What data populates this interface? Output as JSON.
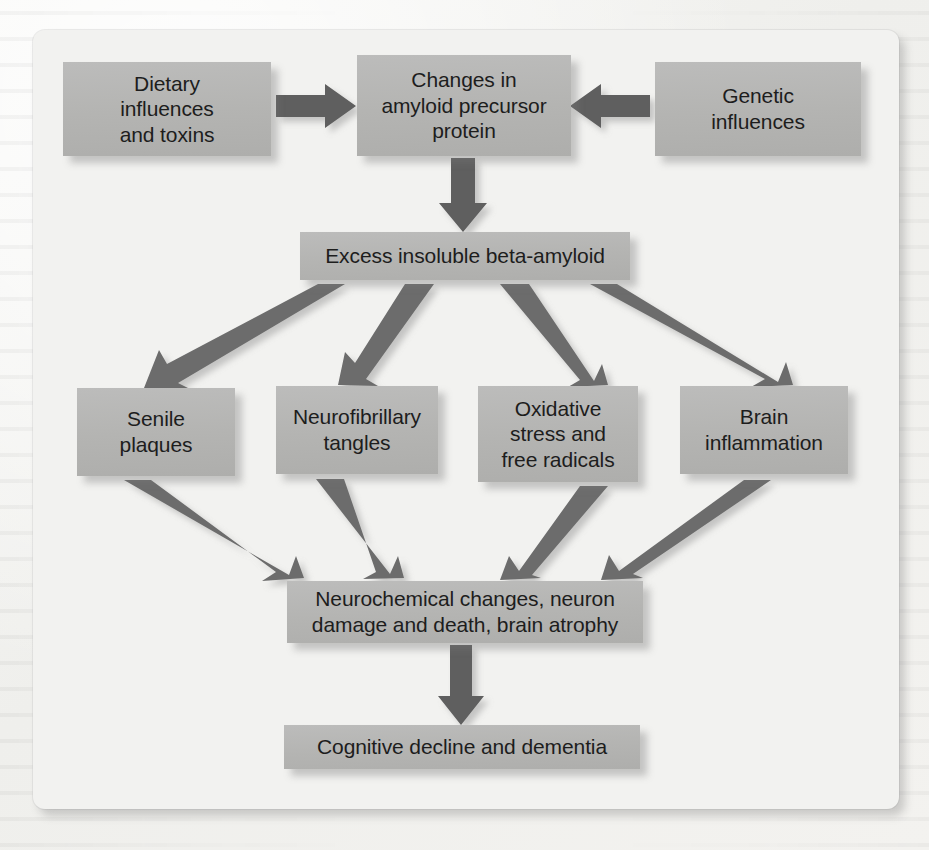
{
  "figure": {
    "type": "flowchart",
    "title": "",
    "orientation": "top-to-bottom",
    "colors": {
      "page_background": "#f4f4f2",
      "panel_background": "#f2f2f0",
      "node_fill": "#b4b4b2",
      "node_text": "#1d1d1d",
      "arrow_fill": "#6c6c6c"
    },
    "nodes": [
      {
        "id": "dietary",
        "label": "Dietary influences and toxins",
        "lines": [
          "Dietary",
          "influences",
          "and toxins"
        ],
        "row": 1
      },
      {
        "id": "app",
        "label": "Changes in amyloid precursor protein",
        "lines": [
          "Changes in",
          "amyloid precursor",
          "protein"
        ],
        "row": 1
      },
      {
        "id": "genetic",
        "label": "Genetic influences",
        "lines": [
          "Genetic",
          "influences"
        ],
        "row": 1
      },
      {
        "id": "beta",
        "label": "Excess insoluble beta-amyloid",
        "lines": [
          "Excess insoluble beta-amyloid"
        ],
        "row": 2
      },
      {
        "id": "senile",
        "label": "Senile plaques",
        "lines": [
          "Senile",
          "plaques"
        ],
        "row": 3
      },
      {
        "id": "tangles",
        "label": "Neurofibrillary tangles",
        "lines": [
          "Neurofibrillary",
          "tangles"
        ],
        "row": 3
      },
      {
        "id": "oxidative",
        "label": "Oxidative stress and free radicals",
        "lines": [
          "Oxidative",
          "stress and",
          "free radicals"
        ],
        "row": 3
      },
      {
        "id": "inflammation",
        "label": "Brain inflammation",
        "lines": [
          "Brain",
          "inflammation"
        ],
        "row": 3
      },
      {
        "id": "neurochem",
        "label": "Neurochemical changes, neuron damage and death, brain atrophy",
        "lines": [
          "Neurochemical changes, neuron",
          "damage and death, brain atrophy"
        ],
        "row": 4
      },
      {
        "id": "cognitive",
        "label": "Cognitive decline and dementia",
        "lines": [
          "Cognitive decline and dementia"
        ],
        "row": 5
      }
    ],
    "edges": [
      {
        "from": "dietary",
        "to": "app",
        "direction": "right"
      },
      {
        "from": "genetic",
        "to": "app",
        "direction": "left"
      },
      {
        "from": "app",
        "to": "beta",
        "direction": "down"
      },
      {
        "from": "beta",
        "to": "senile",
        "direction": "down-left"
      },
      {
        "from": "beta",
        "to": "tangles",
        "direction": "down-left"
      },
      {
        "from": "beta",
        "to": "oxidative",
        "direction": "down-right"
      },
      {
        "from": "beta",
        "to": "inflammation",
        "direction": "down-right"
      },
      {
        "from": "senile",
        "to": "neurochem",
        "direction": "down-right"
      },
      {
        "from": "tangles",
        "to": "neurochem",
        "direction": "down-right"
      },
      {
        "from": "oxidative",
        "to": "neurochem",
        "direction": "down-left"
      },
      {
        "from": "inflammation",
        "to": "neurochem",
        "direction": "down-left"
      },
      {
        "from": "neurochem",
        "to": "cognitive",
        "direction": "down"
      }
    ]
  }
}
